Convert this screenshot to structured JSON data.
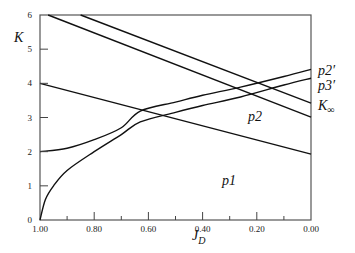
{
  "chart_data": {
    "type": "line",
    "title": "",
    "xlabel": "J_D",
    "ylabel": "K",
    "xlim": [
      1.0,
      0.0
    ],
    "ylim": [
      0,
      6
    ],
    "x_reversed": true,
    "grid": false,
    "legend": "none (inline labels at right edge and inside plot)",
    "xticks": [
      "1.00",
      "0.80",
      "0.60",
      "0.40",
      "0.20",
      "0.00"
    ],
    "xtick_values": [
      1.0,
      0.8,
      0.6,
      0.4,
      0.2,
      0.0
    ],
    "xminor_ticks": [
      0.9,
      0.7,
      0.5,
      0.3,
      0.1
    ],
    "yticks": [
      "0",
      "1",
      "2",
      "3",
      "4",
      "5",
      "6"
    ],
    "ytick_values": [
      0,
      1,
      2,
      3,
      4,
      5,
      6
    ],
    "series": [
      {
        "name": "p2′",
        "x": [
          1.0,
          0.9,
          0.8,
          0.7,
          0.63,
          0.5,
          0.4,
          0.26,
          0.1,
          0.0
        ],
        "values": [
          2.0,
          2.1,
          2.35,
          2.7,
          3.19,
          3.45,
          3.65,
          3.89,
          4.2,
          4.41
        ]
      },
      {
        "name": "p3′",
        "x": [
          1.0,
          0.98,
          0.95,
          0.9,
          0.8,
          0.7,
          0.63,
          0.5,
          0.4,
          0.26,
          0.1,
          0.0
        ],
        "values": [
          0.0,
          0.6,
          1.0,
          1.45,
          2.0,
          2.5,
          2.87,
          3.15,
          3.35,
          3.6,
          3.95,
          4.15
        ]
      },
      {
        "name": "K∞",
        "x": [
          0.85,
          0.0
        ],
        "values": [
          6.0,
          3.42
        ]
      },
      {
        "name": "upper line",
        "x": [
          0.97,
          0.0
        ],
        "values": [
          6.0,
          3.01
        ]
      },
      {
        "name": "lower line",
        "x": [
          1.0,
          0.0
        ],
        "values": [
          4.0,
          1.93
        ]
      }
    ],
    "annotations": [
      {
        "text": "p2′",
        "x": 0.0,
        "y": 4.5,
        "position": "right of axis"
      },
      {
        "text": "p3′",
        "x": 0.0,
        "y": 4.05,
        "position": "right of axis"
      },
      {
        "text": "K∞",
        "x": 0.0,
        "y": 3.3,
        "position": "right of axis"
      },
      {
        "text": "p2",
        "x": 0.23,
        "y": 3.0
      },
      {
        "text": "p1",
        "x": 0.26,
        "y": 1.5
      }
    ]
  },
  "labels": {
    "ylabel": "K",
    "xlabel_main": "J",
    "xlabel_sub": "D",
    "p2prime": "p2′",
    "p3prime": "p3′",
    "kinf": "K",
    "kinf_sub": "∞",
    "p2": "p2",
    "p1": "p1"
  }
}
